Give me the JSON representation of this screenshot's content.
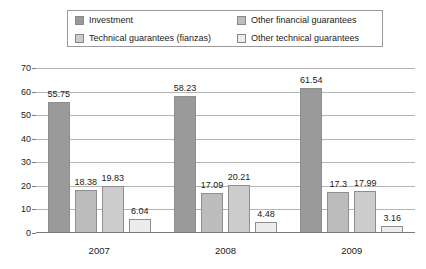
{
  "legend": {
    "items": [
      {
        "label": "Investment",
        "color": "#9a9a9a",
        "swatch_name": "legend-swatch-investment"
      },
      {
        "label": "Other financial guarantees",
        "color": "#bcbcbc",
        "swatch_name": "legend-swatch-other-financial"
      },
      {
        "label": "Technical guarantees (fianzas)",
        "color": "#cccccc",
        "swatch_name": "legend-swatch-technical"
      },
      {
        "label": "Other technical guarantees",
        "color": "#ececec",
        "swatch_name": "legend-swatch-other-technical"
      }
    ]
  },
  "axis": {
    "y_ticks": [
      "0",
      "10",
      "20",
      "30",
      "40",
      "50",
      "60",
      "70"
    ],
    "x_labels": [
      "2007",
      "2008",
      "2009"
    ]
  },
  "chart_data": {
    "type": "bar",
    "title": "",
    "subtitle": "",
    "xlabel": "",
    "ylabel": "",
    "ylim": [
      0,
      70
    ],
    "ytick_step": 10,
    "grid": true,
    "legend_position": "top",
    "categories": [
      "2007",
      "2008",
      "2009"
    ],
    "series": [
      {
        "name": "Investment",
        "color": "#9a9a9a",
        "values": [
          55.75,
          58.23,
          61.54
        ],
        "labels": [
          "55.75",
          "58.23",
          "61.54"
        ]
      },
      {
        "name": "Other financial guarantees",
        "color": "#bcbcbc",
        "values": [
          18.38,
          17.09,
          17.3
        ],
        "labels": [
          "18.38",
          "17.09",
          "17.3"
        ]
      },
      {
        "name": "Technical guarantees (fianzas)",
        "color": "#cccccc",
        "values": [
          19.83,
          20.21,
          17.99
        ],
        "labels": [
          "19.83",
          "20.21",
          "17.99"
        ]
      },
      {
        "name": "Other technical guarantees",
        "color": "#ececec",
        "values": [
          6.04,
          4.48,
          3.16
        ],
        "labels": [
          "6.04",
          "4.48",
          "3.16"
        ]
      }
    ]
  }
}
